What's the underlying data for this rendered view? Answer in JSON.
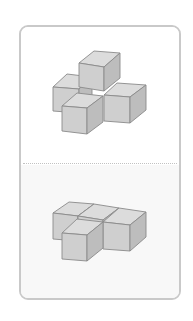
{
  "card": {
    "border_color": "#c9c9c9",
    "top_panel_bg": "#ffffff",
    "bottom_panel_bg": "#f8f8f8",
    "divider_style": "dotted"
  },
  "colors": {
    "top_face": "#dcdcdc",
    "front_face": "#cfcfcf",
    "right_face": "#bdbdbd",
    "edge": "#8a8a8a"
  },
  "figures": [
    {
      "name": "cube-figure-top",
      "description": "Isometric arrangement of 5 cubes: cross of 4 with one stacked on top of center",
      "cubes": [
        {
          "name": "left-back-cube",
          "top": "53,87 67,74 92,77 79,89",
          "front": "53,87 79,89 79,113 53,111",
          "right": "79,89 92,77 92,101 79,113"
        },
        {
          "name": "stacked-top-cube",
          "top": "79,63 94,51 120,53 104,67",
          "front": "79,63 104,67 104,91 79,87",
          "right": "104,67 120,53 120,78 104,91"
        },
        {
          "name": "right-cube",
          "top": "104,95 117,83 146,85 130,97",
          "front": "104,95 130,97 130,123 104,121",
          "right": "130,97 146,85 146,110 130,123"
        },
        {
          "name": "front-cube",
          "top": "62,106 77,93 103,96 87,108",
          "front": "62,106 87,108 87,134 62,131",
          "right": "87,108 103,96 103,122 87,134"
        }
      ]
    },
    {
      "name": "cube-figure-bottom",
      "description": "Isometric arrangement of 4 cubes in a flat T shape",
      "cubes": [
        {
          "name": "left-back-cube",
          "top": "53,213 69,202 94,204 78,216",
          "front": "53,213 78,216 78,241 53,239",
          "right": "78,216 94,204 94,229 78,241"
        },
        {
          "name": "middle-back-cube",
          "top": "78,216 94,204 119,208 103,220",
          "front": "78,216 103,220 103,245 78,241",
          "right": "103,220 119,208 119,233 103,245"
        },
        {
          "name": "right-cube",
          "top": "103,222 119,208 146,212 130,225",
          "front": "103,222 130,225 130,251 103,249",
          "right": "130,225 146,212 146,237 130,251"
        },
        {
          "name": "front-cube",
          "top": "62,233 77,219 103,222 87,235",
          "front": "62,233 87,235 87,261 62,259",
          "right": "87,235 103,222 103,248 87,261"
        }
      ]
    }
  ]
}
